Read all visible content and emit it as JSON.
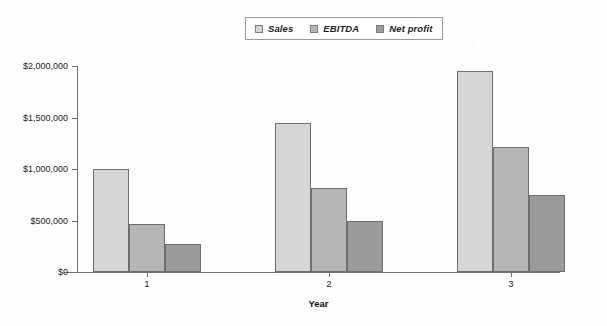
{
  "chart_data": {
    "type": "bar",
    "title": "",
    "subtitle": "",
    "xlabel": "Year",
    "ylabel": "",
    "categories": [
      "1",
      "2",
      "3"
    ],
    "series": [
      {
        "name": "Sales",
        "values": [
          1000000,
          1450000,
          1950000
        ],
        "color": "#d6d6d6"
      },
      {
        "name": "EBITDA",
        "values": [
          465000,
          820000,
          1215000
        ],
        "color": "#b6b6b6"
      },
      {
        "name": "Net profit",
        "values": [
          270000,
          495000,
          745000
        ],
        "color": "#9b9b9b"
      }
    ],
    "ylim": [
      0,
      2000000
    ],
    "yticks": [
      0,
      500000,
      1000000,
      1500000,
      2000000
    ],
    "ytick_labels": [
      "$0",
      "$500,000",
      "$1,000,000",
      "$1,500,000",
      "$2,000,000"
    ],
    "grid": false,
    "legend_position": "top-center",
    "bar_border_color": "#6e6e6e",
    "axis_color": "#6f6f6f",
    "background_color": "#ffffff"
  },
  "legend": {
    "items": [
      {
        "label": "Sales",
        "swatch_color": "#d6d6d6",
        "icon": "legend-swatch-icon"
      },
      {
        "label": "EBITDA",
        "swatch_color": "#b6b6b6",
        "icon": "legend-swatch-icon"
      },
      {
        "label": "Net profit",
        "swatch_color": "#9b9b9b",
        "icon": "legend-swatch-icon"
      }
    ]
  },
  "axes": {
    "x": {
      "title": "Year",
      "tick_labels": [
        "1",
        "2",
        "3"
      ]
    },
    "y": {
      "title": "",
      "tick_labels": [
        "$0",
        "$500,000",
        "$1,000,000",
        "$1,500,000",
        "$2,000,000"
      ]
    }
  }
}
